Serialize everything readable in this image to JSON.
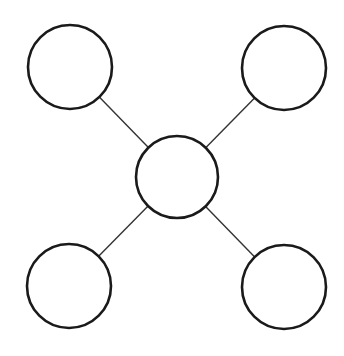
{
  "diagram": {
    "type": "star-network",
    "background": "#ffffff",
    "stroke_color": "#1a1a1a",
    "edge_color": "#333333",
    "nodes": [
      {
        "id": "center",
        "label": "",
        "cx": 177,
        "cy": 177,
        "r": 41
      },
      {
        "id": "top-left",
        "label": "",
        "cx": 70,
        "cy": 67,
        "r": 42
      },
      {
        "id": "top-right",
        "label": "",
        "cx": 284,
        "cy": 68,
        "r": 42
      },
      {
        "id": "bottom-left",
        "label": "",
        "cx": 69,
        "cy": 286,
        "r": 42
      },
      {
        "id": "bottom-right",
        "label": "",
        "cx": 284,
        "cy": 287,
        "r": 42
      }
    ],
    "edges": [
      {
        "from": "center",
        "to": "top-left"
      },
      {
        "from": "center",
        "to": "top-right"
      },
      {
        "from": "center",
        "to": "bottom-left"
      },
      {
        "from": "center",
        "to": "bottom-right"
      }
    ]
  }
}
